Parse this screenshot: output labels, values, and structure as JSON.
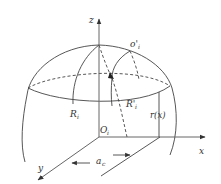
{
  "diagram": {
    "type": "3d geometry sketch: spherical cap with coordinate axes",
    "labels": {
      "z_axis": "z",
      "x_axis": "x",
      "y_axis": "y",
      "origin": "O",
      "origin_sub": "i",
      "top_point": "o'",
      "top_point_sub": "i",
      "radius_left": "R",
      "radius_left_sub": "i",
      "radius_right": "R'",
      "radius_right_sub": "i",
      "radius_function": "r(x)",
      "offset": "a",
      "offset_sub": "c"
    },
    "colors": {
      "stroke": "#444444",
      "axis": "#666666",
      "text": "#333333",
      "background": "#ffffff"
    }
  }
}
